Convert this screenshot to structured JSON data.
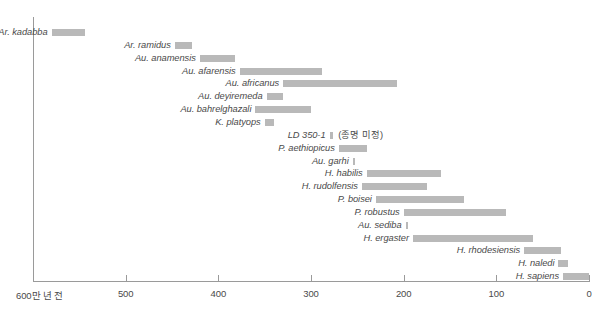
{
  "chart_data": {
    "type": "bar",
    "orientation": "horizontal-range",
    "title": "",
    "xlabel": "",
    "ylabel": "",
    "xlim": [
      600,
      0
    ],
    "x_unit_note": "600만 년 전",
    "axis_ticks": [
      {
        "value": 600,
        "label": "600만 년 전"
      },
      {
        "value": 500,
        "label": "500"
      },
      {
        "value": 400,
        "label": "400"
      },
      {
        "value": 300,
        "label": "300"
      },
      {
        "value": 200,
        "label": "200"
      },
      {
        "value": 100,
        "label": "100"
      },
      {
        "value": 0,
        "label": "0"
      }
    ],
    "grid": false,
    "legend": "none",
    "bar_color": "#b9b9b9",
    "categories": [
      "Ar. kadabba",
      "Ar. ramidus",
      "Au. anamensis",
      "Au. afarensis",
      "Au. africanus",
      "Au. deyiremeda",
      "Au. bahrelghazali",
      "K. platyops",
      "LD 350-1",
      "P. aethiopicus",
      "Au. garhi",
      "H. habilis",
      "H. rudolfensis",
      "P. boisei",
      "P. robustus",
      "Au. sediba",
      "H. ergaster",
      "H. rhodesiensis",
      "H. naledi",
      "H. sapiens"
    ],
    "ranges": [
      {
        "name": "Ar. kadabba",
        "start": 580,
        "end": 544,
        "note": ""
      },
      {
        "name": "Ar. ramidus",
        "start": 447,
        "end": 428,
        "note": ""
      },
      {
        "name": "Au. anamensis",
        "start": 420,
        "end": 382,
        "note": ""
      },
      {
        "name": "Au. afarensis",
        "start": 377,
        "end": 288,
        "note": ""
      },
      {
        "name": "Au. africanus",
        "start": 330,
        "end": 207,
        "note": ""
      },
      {
        "name": "Au. deyiremeda",
        "start": 348,
        "end": 330,
        "note": ""
      },
      {
        "name": "Au. bahrelghazali",
        "start": 360,
        "end": 300,
        "note": ""
      },
      {
        "name": "K. platyops",
        "start": 350,
        "end": 340,
        "note": ""
      },
      {
        "name": "LD 350-1",
        "start": 280,
        "end": 276,
        "note": "(종명 미정)"
      },
      {
        "name": "P. aethiopicus",
        "start": 270,
        "end": 240,
        "note": ""
      },
      {
        "name": "Au. garhi",
        "start": 255,
        "end": 252,
        "note": ""
      },
      {
        "name": "H. habilis",
        "start": 240,
        "end": 160,
        "note": ""
      },
      {
        "name": "H. rudolfensis",
        "start": 245,
        "end": 175,
        "note": ""
      },
      {
        "name": "P. boisei",
        "start": 230,
        "end": 135,
        "note": ""
      },
      {
        "name": "P. robustus",
        "start": 200,
        "end": 90,
        "note": ""
      },
      {
        "name": "Au. sediba",
        "start": 198,
        "end": 196,
        "note": ""
      },
      {
        "name": "H. ergaster",
        "start": 190,
        "end": 60,
        "note": ""
      },
      {
        "name": "H. rhodesiensis",
        "start": 70,
        "end": 30,
        "note": ""
      },
      {
        "name": "H. naledi",
        "start": 33,
        "end": 23,
        "note": ""
      },
      {
        "name": "H. sapiens",
        "start": 28,
        "end": 0,
        "note": ""
      }
    ]
  }
}
